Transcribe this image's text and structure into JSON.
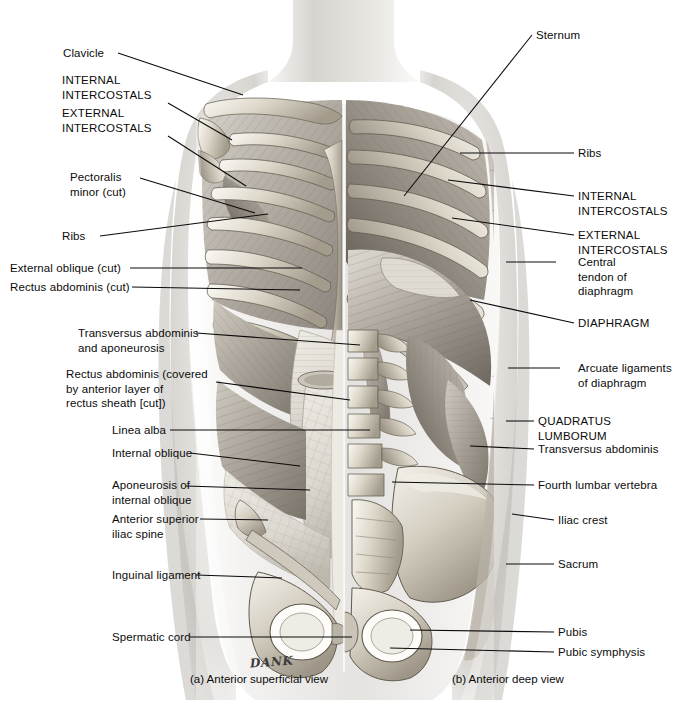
{
  "figure": {
    "signature": "DANK"
  },
  "captions": [
    {
      "id": "caption-a",
      "text": "(a) Anterior superficial view",
      "x": 190,
      "y": 672
    },
    {
      "id": "caption-b",
      "text": "(b) Anterior deep view",
      "x": 452,
      "y": 672
    }
  ],
  "labels_left": [
    {
      "id": "clavicle",
      "text": "Clavicle",
      "x": 63,
      "y": 46,
      "anchor_x": 118,
      "anchor_y": 53,
      "target_x": 243,
      "target_y": 95
    },
    {
      "id": "internal-intercostals-left",
      "text": "INTERNAL\nINTERCOSTALS",
      "x": 62,
      "y": 73,
      "anchor_x": 168,
      "anchor_y": 103,
      "target_x": 232,
      "target_y": 140,
      "caps": true
    },
    {
      "id": "external-intercostals-left",
      "text": "EXTERNAL\nINTERCOSTALS",
      "x": 62,
      "y": 106,
      "anchor_x": 168,
      "anchor_y": 136,
      "target_x": 246,
      "target_y": 186,
      "caps": true
    },
    {
      "id": "pectoralis-minor-cut",
      "text": "Pectoralis\nminor (cut)",
      "x": 70,
      "y": 170,
      "anchor_x": 140,
      "anchor_y": 178,
      "target_x": 255,
      "target_y": 213
    },
    {
      "id": "ribs-left",
      "text": "Ribs",
      "x": 62,
      "y": 229,
      "anchor_x": 100,
      "anchor_y": 236,
      "target_x": 268,
      "target_y": 214
    },
    {
      "id": "external-oblique-cut",
      "text": "External oblique (cut)",
      "x": 10,
      "y": 261,
      "anchor_x": 130,
      "anchor_y": 268,
      "target_x": 302,
      "target_y": 268
    },
    {
      "id": "rectus-abdominis-cut",
      "text": "Rectus abdominis (cut)",
      "x": 10,
      "y": 280,
      "anchor_x": 132,
      "anchor_y": 287,
      "target_x": 300,
      "target_y": 290
    },
    {
      "id": "transversus-abdominis-aponeurosis",
      "text": "Transversus abdominis\nand aponeurosis",
      "x": 78,
      "y": 326,
      "anchor_x": 196,
      "anchor_y": 333,
      "target_x": 360,
      "target_y": 345
    },
    {
      "id": "rectus-abdominis-covered",
      "text": "Rectus abdominis (covered\nby anterior layer of\nrectus sheath [cut])",
      "x": 66,
      "y": 367,
      "anchor_x": 216,
      "anchor_y": 382,
      "target_x": 350,
      "target_y": 400
    },
    {
      "id": "linea-alba",
      "text": "Linea alba",
      "x": 112,
      "y": 423,
      "anchor_x": 170,
      "anchor_y": 430,
      "target_x": 370,
      "target_y": 430
    },
    {
      "id": "internal-oblique",
      "text": "Internal oblique",
      "x": 112,
      "y": 446,
      "anchor_x": 190,
      "anchor_y": 453,
      "target_x": 300,
      "target_y": 466
    },
    {
      "id": "aponeurosis-internal-oblique",
      "text": "Aponeurosis of\ninternal oblique",
      "x": 112,
      "y": 478,
      "anchor_x": 186,
      "anchor_y": 486,
      "target_x": 310,
      "target_y": 490
    },
    {
      "id": "anterior-superior-iliac-spine",
      "text": "Anterior superior\niliac spine",
      "x": 112,
      "y": 512,
      "anchor_x": 200,
      "anchor_y": 519,
      "target_x": 268,
      "target_y": 520
    },
    {
      "id": "inguinal-ligament",
      "text": "Inguinal ligament",
      "x": 112,
      "y": 568,
      "anchor_x": 196,
      "anchor_y": 575,
      "target_x": 282,
      "target_y": 578
    },
    {
      "id": "spermatic-cord",
      "text": "Spermatic cord",
      "x": 112,
      "y": 630,
      "anchor_x": 190,
      "anchor_y": 637,
      "target_x": 352,
      "target_y": 637
    }
  ],
  "labels_right": [
    {
      "id": "sternum",
      "text": "Sternum",
      "x": 536,
      "y": 28,
      "anchor_x": 532,
      "anchor_y": 35,
      "target_x": 404,
      "target_y": 196
    },
    {
      "id": "ribs-right",
      "text": "Ribs",
      "x": 578,
      "y": 146,
      "anchor_x": 574,
      "anchor_y": 153,
      "target_x": 460,
      "target_y": 153
    },
    {
      "id": "internal-intercostals-right",
      "text": "INTERNAL\nINTERCOSTALS",
      "x": 578,
      "y": 189,
      "anchor_x": 574,
      "anchor_y": 196,
      "target_x": 448,
      "target_y": 180,
      "caps": true
    },
    {
      "id": "external-intercostals-right",
      "text": "EXTERNAL\nINTERCOSTALS",
      "x": 578,
      "y": 228,
      "anchor_x": 574,
      "anchor_y": 235,
      "target_x": 452,
      "target_y": 218,
      "caps": true
    },
    {
      "id": "central-tendon-diaphragm",
      "text": "Central\ntendon of\ndiaphragm",
      "x": 578,
      "y": 255,
      "anchor_x": 556,
      "anchor_y": 262,
      "target_x": 506,
      "target_y": 262
    },
    {
      "id": "diaphragm",
      "text": "DIAPHRAGM",
      "x": 578,
      "y": 316,
      "anchor_x": 574,
      "anchor_y": 323,
      "target_x": 470,
      "target_y": 300,
      "caps": true
    },
    {
      "id": "arcuate-ligaments",
      "text": "Arcuate ligaments\nof diaphragm",
      "x": 578,
      "y": 361,
      "anchor_x": 560,
      "anchor_y": 368,
      "target_x": 508,
      "target_y": 368
    },
    {
      "id": "quadratus-lumborum",
      "text": "QUADRATUS LUMBORUM",
      "x": 538,
      "y": 414,
      "anchor_x": 534,
      "anchor_y": 421,
      "target_x": 506,
      "target_y": 421,
      "caps": true
    },
    {
      "id": "transversus-abdominis-right",
      "text": "Transversus abdominis",
      "x": 538,
      "y": 442,
      "anchor_x": 534,
      "anchor_y": 449,
      "target_x": 470,
      "target_y": 446
    },
    {
      "id": "fourth-lumbar-vertebra",
      "text": "Fourth lumbar vertebra",
      "x": 538,
      "y": 478,
      "anchor_x": 534,
      "anchor_y": 485,
      "target_x": 392,
      "target_y": 482
    },
    {
      "id": "iliac-crest",
      "text": "Iliac crest",
      "x": 558,
      "y": 513,
      "anchor_x": 554,
      "anchor_y": 520,
      "target_x": 512,
      "target_y": 514
    },
    {
      "id": "sacrum",
      "text": "Sacrum",
      "x": 558,
      "y": 557,
      "anchor_x": 554,
      "anchor_y": 564,
      "target_x": 506,
      "target_y": 564
    },
    {
      "id": "pubis",
      "text": "Pubis",
      "x": 558,
      "y": 625,
      "anchor_x": 554,
      "anchor_y": 632,
      "target_x": 410,
      "target_y": 630
    },
    {
      "id": "pubic-symphysis",
      "text": "Pubic symphysis",
      "x": 558,
      "y": 645,
      "anchor_x": 554,
      "anchor_y": 652,
      "target_x": 390,
      "target_y": 648
    }
  ],
  "colors": {
    "ink": "#0a0a0a",
    "skin_light": "#f0efee",
    "skin_mid": "#cfcdc9",
    "skin_shadow": "#9a9793",
    "bone_light": "#efece5",
    "bone_mid": "#cdc7bb",
    "bone_dark": "#8e887c",
    "muscle_light": "#d8d4cc",
    "muscle_mid": "#a8a29a",
    "muscle_dark": "#6f6a63",
    "deep_shadow": "#4a4642"
  }
}
